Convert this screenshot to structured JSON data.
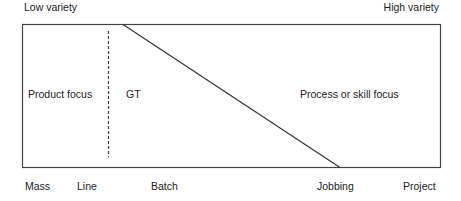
{
  "top_labels": {
    "left": "Low variety",
    "right": "High variety"
  },
  "regions": {
    "product_focus": "Product focus",
    "gt": "GT",
    "process_focus": "Process or skill focus"
  },
  "process_types": [
    "Mass",
    "Line",
    "Batch",
    "Jobbing",
    "Project"
  ],
  "colors": {
    "line": "#333333",
    "text": "#222222",
    "background": "#ffffff"
  }
}
